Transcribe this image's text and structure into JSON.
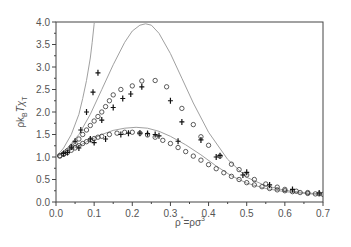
{
  "chart_data": {
    "type": "line",
    "title": "",
    "xlabel": "ρ* = ρσ³",
    "xlabel_parts": {
      "base": "ρ",
      "sup1": "*",
      "mid": "=ρσ",
      "sup2": "3"
    },
    "ylabel": "ρk_B Tχ_T",
    "ylabel_parts": {
      "a": "ρk",
      "a_sub": "B",
      "b": "Tχ",
      "b_sub": "T"
    },
    "xlim": [
      0.0,
      0.7
    ],
    "ylim": [
      0.0,
      4.0
    ],
    "x_ticks": [
      "0.0",
      "0.1",
      "0.2",
      "0.3",
      "0.4",
      "0.5",
      "0.6",
      "0.7"
    ],
    "y_ticks": [
      "0.0",
      "0.5",
      "1.0",
      "1.5",
      "2.0",
      "2.5",
      "3.0",
      "3.5",
      "4.0"
    ],
    "grid": false,
    "legend": null,
    "colors": {
      "curve": "#a0a0a0",
      "marker": "#333333",
      "axis": "#444444",
      "text": "#555555"
    },
    "series": [
      {
        "name": "theory-steep",
        "kind": "curve",
        "x": [
          0.0,
          0.02,
          0.04,
          0.06,
          0.07,
          0.08,
          0.09,
          0.095,
          0.1,
          0.105
        ],
        "y": [
          1.0,
          1.2,
          1.5,
          1.95,
          2.3,
          2.7,
          3.2,
          3.55,
          3.95,
          4.4
        ]
      },
      {
        "name": "theory-high-peak",
        "kind": "curve",
        "x": [
          0.0,
          0.03,
          0.06,
          0.09,
          0.12,
          0.15,
          0.18,
          0.2,
          0.22,
          0.235,
          0.25,
          0.27,
          0.3,
          0.33,
          0.36,
          0.4,
          0.45,
          0.5,
          0.55,
          0.6,
          0.65,
          0.7
        ],
        "y": [
          1.0,
          1.2,
          1.5,
          1.95,
          2.5,
          3.05,
          3.55,
          3.8,
          3.93,
          3.96,
          3.93,
          3.75,
          3.3,
          2.75,
          2.2,
          1.55,
          0.95,
          0.55,
          0.36,
          0.26,
          0.21,
          0.17
        ]
      },
      {
        "name": "theory-low-peak",
        "kind": "curve",
        "x": [
          0.0,
          0.03,
          0.06,
          0.09,
          0.12,
          0.15,
          0.18,
          0.21,
          0.24,
          0.27,
          0.3,
          0.34,
          0.38,
          0.42,
          0.46,
          0.5,
          0.55,
          0.6,
          0.65,
          0.7
        ],
        "y": [
          1.0,
          1.12,
          1.25,
          1.38,
          1.5,
          1.59,
          1.64,
          1.66,
          1.64,
          1.57,
          1.46,
          1.27,
          1.05,
          0.8,
          0.58,
          0.42,
          0.3,
          0.23,
          0.19,
          0.16
        ]
      },
      {
        "name": "sim-circles-high",
        "kind": "circles",
        "x": [
          0.01,
          0.02,
          0.03,
          0.04,
          0.05,
          0.06,
          0.07,
          0.08,
          0.09,
          0.1,
          0.11,
          0.12,
          0.13,
          0.14,
          0.15,
          0.17,
          0.2,
          0.225,
          0.26,
          0.29,
          0.33,
          0.36,
          0.38,
          0.4,
          0.43,
          0.46,
          0.48,
          0.5,
          0.52,
          0.55,
          0.58,
          0.6,
          0.63,
          0.66,
          0.69
        ],
        "y": [
          1.03,
          1.07,
          1.14,
          1.22,
          1.3,
          1.4,
          1.5,
          1.6,
          1.7,
          1.8,
          1.9,
          2.0,
          2.12,
          2.25,
          2.38,
          2.5,
          2.58,
          2.69,
          2.7,
          2.56,
          2.08,
          1.72,
          1.45,
          1.26,
          1.02,
          0.84,
          0.72,
          0.6,
          0.5,
          0.4,
          0.33,
          0.28,
          0.24,
          0.21,
          0.18
        ]
      },
      {
        "name": "sim-circles-low",
        "kind": "circles",
        "x": [
          0.01,
          0.02,
          0.03,
          0.04,
          0.05,
          0.06,
          0.07,
          0.08,
          0.09,
          0.1,
          0.11,
          0.12,
          0.14,
          0.16,
          0.18,
          0.2,
          0.22,
          0.24,
          0.26,
          0.28,
          0.3,
          0.32,
          0.34,
          0.36,
          0.38,
          0.4,
          0.42,
          0.44,
          0.46,
          0.48,
          0.5,
          0.52,
          0.54,
          0.56,
          0.58,
          0.6,
          0.62,
          0.64,
          0.66,
          0.68,
          0.7
        ],
        "y": [
          1.02,
          1.06,
          1.1,
          1.15,
          1.2,
          1.25,
          1.3,
          1.34,
          1.38,
          1.41,
          1.44,
          1.46,
          1.5,
          1.53,
          1.55,
          1.55,
          1.53,
          1.49,
          1.44,
          1.37,
          1.3,
          1.21,
          1.12,
          1.02,
          0.93,
          0.83,
          0.74,
          0.65,
          0.57,
          0.5,
          0.43,
          0.38,
          0.34,
          0.3,
          0.27,
          0.25,
          0.23,
          0.21,
          0.19,
          0.18,
          0.17
        ]
      },
      {
        "name": "sim-crosses",
        "kind": "crosses",
        "x": [
          0.02,
          0.04,
          0.05,
          0.065,
          0.08,
          0.097,
          0.11,
          0.09,
          0.12,
          0.15,
          0.175,
          0.196,
          0.225,
          0.26,
          0.3,
          0.33,
          0.38,
          0.43,
          0.49,
          0.56,
          0.62,
          0.69,
          0.03,
          0.06,
          0.1,
          0.13,
          0.17,
          0.19,
          0.22,
          0.24,
          0.27,
          0.32,
          0.42,
          0.5
        ],
        "y": [
          1.08,
          1.22,
          1.35,
          1.6,
          2.0,
          2.44,
          2.87,
          1.4,
          1.82,
          2.1,
          2.3,
          2.4,
          2.56,
          1.5,
          2.25,
          1.78,
          1.38,
          1.03,
          0.6,
          0.38,
          0.28,
          0.2,
          1.1,
          1.2,
          1.32,
          1.4,
          1.5,
          1.53,
          1.53,
          1.52,
          1.47,
          1.35,
          1.0,
          0.66
        ]
      }
    ]
  }
}
